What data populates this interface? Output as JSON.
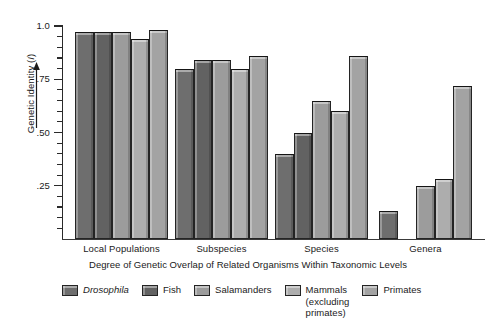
{
  "chart_data": {
    "type": "bar",
    "title": "",
    "xlabel": "Degree of Genetic Overlap of Related Organisms Within Taxonomic Levels",
    "ylabel": "Genetic Identity (I)",
    "ylim": [
      0,
      1.0
    ],
    "ytick_labels": [
      "1.0",
      ".75",
      ".50",
      ".25"
    ],
    "ytick_values": [
      1.0,
      0.75,
      0.5,
      0.25
    ],
    "minor_tick_step": 0.05,
    "grid": false,
    "legend_position": "bottom",
    "categories": [
      "Local Populations",
      "Subspecies",
      "Species",
      "Genera"
    ],
    "series": [
      {
        "name": "Drosophila",
        "italic": true,
        "color": "#6e6e6e",
        "values": [
          0.97,
          0.8,
          0.4,
          0.13
        ]
      },
      {
        "name": "Fish",
        "italic": false,
        "color": "#626262",
        "values": [
          0.97,
          0.84,
          0.5,
          null
        ]
      },
      {
        "name": "Salamanders",
        "italic": false,
        "color": "#9c9c9c",
        "values": [
          0.97,
          0.84,
          0.65,
          0.25
        ]
      },
      {
        "name": "Mammals\n(excluding\nprimates)",
        "italic": false,
        "color": "#adadad",
        "values": [
          0.94,
          0.8,
          0.6,
          0.28
        ]
      },
      {
        "name": "Primates",
        "italic": false,
        "color": "#a3a3a3",
        "values": [
          0.98,
          0.86,
          0.86,
          0.72
        ]
      }
    ]
  },
  "axis": {
    "y_title_main": "Genetic Identity (",
    "y_title_italic": "I",
    "y_title_close": ")"
  }
}
